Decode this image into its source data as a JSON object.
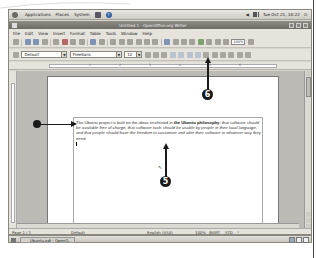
{
  "panel": {
    "menus": [
      "Applications",
      "Places",
      "System"
    ],
    "clock": "Tue Oct 21, 10:22"
  },
  "window": {
    "title": "Untitled 1 - OpenOffice.org Writer"
  },
  "menubar": {
    "items": [
      "File",
      "Edit",
      "View",
      "Insert",
      "Format",
      "Table",
      "Tools",
      "Window",
      "Help"
    ]
  },
  "toolbar": {
    "zoom_value": "100%"
  },
  "formatting": {
    "style": "Default",
    "font": "FreeSans",
    "size": "12"
  },
  "ruler": {
    "ticks": [
      "1",
      "2",
      "3",
      "4",
      "5",
      "6"
    ]
  },
  "document": {
    "text_plain_1": "The Ubuntu project is built on the ideas enshrined in ",
    "text_bold": "the Ubuntu philosophy",
    "text_plain_2": ": ",
    "text_italic": "that software should be available free of charge, that software tools should be usable by people in their local language, and that people should have the freedom to customize and alter their software in whatever way they need."
  },
  "statusbar": {
    "page": "Page 1 / 1",
    "style": "Default",
    "language": "English (USA)",
    "zoom": "100%",
    "insert_mode": "INSRT",
    "selection_mode": "STD",
    "modified": "*"
  },
  "taskbar": {
    "task_label": "Ubuntu.odt - OpenO..."
  },
  "callouts": {
    "five": "5",
    "six": "6"
  }
}
